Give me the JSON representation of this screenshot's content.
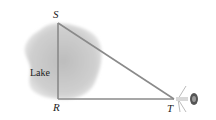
{
  "diagram": {
    "type": "geometry-triangle",
    "region_label": "Lake",
    "points": [
      {
        "id": "S",
        "label": "S",
        "x": 58,
        "y": 23
      },
      {
        "id": "R",
        "label": "R",
        "x": 58,
        "y": 99
      },
      {
        "id": "T",
        "label": "T",
        "x": 174,
        "y": 99
      }
    ],
    "segments": [
      {
        "from": "S",
        "to": "R"
      },
      {
        "from": "R",
        "to": "T"
      },
      {
        "from": "S",
        "to": "T"
      }
    ],
    "right_angle_at": "R",
    "instrument_at": "T",
    "colors": {
      "line": "#8a8a8a",
      "lake_fill": "#c8c8c8",
      "text": "#222222"
    }
  }
}
